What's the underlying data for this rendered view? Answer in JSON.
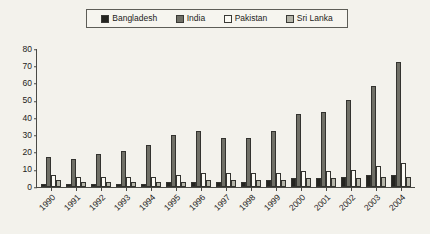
{
  "legend": {
    "items": [
      {
        "label": "Bangladesh",
        "color": "#242420"
      },
      {
        "label": "India",
        "color": "#6f6f66"
      },
      {
        "label": "Pakistan",
        "color": "#fbfaf4"
      },
      {
        "label": "Sri Lanka",
        "color": "#b4b4a8"
      }
    ]
  },
  "axis": {
    "yticks": [
      "80",
      "70",
      "60",
      "50",
      "40",
      "30",
      "20",
      "10",
      "0"
    ]
  },
  "chart_data": {
    "type": "bar",
    "title": "",
    "xlabel": "",
    "ylabel": "",
    "ylim": [
      0,
      80
    ],
    "ystep": 10,
    "grid": false,
    "legend_position": "top",
    "categories": [
      "1990",
      "1991",
      "1992",
      "1993",
      "1994",
      "1995",
      "1996",
      "1997",
      "1998",
      "1999",
      "2000",
      "2001",
      "2002",
      "2003",
      "2004"
    ],
    "series": [
      {
        "name": "Bangladesh",
        "color": "#242420",
        "values": [
          2,
          2,
          2,
          2,
          2,
          3,
          3,
          3,
          3,
          4,
          5,
          5,
          6,
          7,
          7
        ]
      },
      {
        "name": "India",
        "color": "#6f6f66",
        "values": [
          17,
          16,
          19,
          21,
          24,
          30,
          32,
          28,
          28,
          32,
          42,
          43,
          50,
          58,
          72
        ]
      },
      {
        "name": "Pakistan",
        "color": "#fbfaf4",
        "values": [
          7,
          6,
          6,
          6,
          6,
          7,
          8,
          8,
          8,
          8,
          9,
          9,
          10,
          12,
          14
        ]
      },
      {
        "name": "Sri Lanka",
        "color": "#b4b4a8",
        "values": [
          4,
          3,
          3,
          3,
          3,
          3,
          4,
          4,
          4,
          4,
          5,
          5,
          5,
          6,
          6
        ]
      }
    ]
  }
}
